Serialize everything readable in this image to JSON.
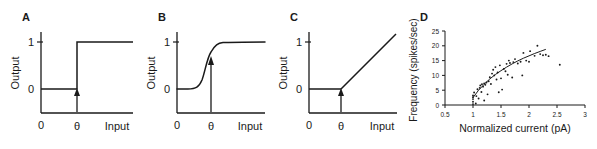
{
  "figure": {
    "background": "#ffffff",
    "ink": "#1a1a1a",
    "panel_count": 4
  },
  "panels": {
    "a": {
      "letter": "A"
    },
    "b": {
      "letter": "B"
    },
    "c": {
      "letter": "C"
    },
    "d": {
      "letter": "D"
    }
  },
  "chart_data": [
    {
      "id": "A",
      "type": "line",
      "title": "",
      "subtitle": "",
      "xlabel": "Input",
      "ylabel": "Output",
      "xticks": [
        0
      ],
      "xticklabels": [
        "0"
      ],
      "yticks": [
        0,
        1
      ],
      "yticklabels": [
        "0",
        "1"
      ],
      "xlim": [
        0,
        10
      ],
      "ylim": [
        0,
        1.25
      ],
      "grid": false,
      "legend": null,
      "function": "heaviside-step",
      "threshold_label": "θ",
      "threshold_x": 4.0,
      "annotations": [
        {
          "kind": "arrow",
          "label": "θ",
          "x": 4.0,
          "points_to_y": 0.0,
          "direction": "up"
        }
      ],
      "x": [
        0,
        1,
        2,
        3,
        3.99,
        4.0,
        5,
        6,
        7,
        8,
        9,
        10
      ],
      "values": [
        0,
        0,
        0,
        0,
        0,
        1,
        1,
        1,
        1,
        1,
        1,
        1
      ]
    },
    {
      "id": "B",
      "type": "line",
      "title": "",
      "subtitle": "",
      "xlabel": "Input",
      "ylabel": "Output",
      "xticks": [
        0
      ],
      "xticklabels": [
        "0"
      ],
      "yticks": [
        0,
        1
      ],
      "yticklabels": [
        "0",
        "1"
      ],
      "xlim": [
        0,
        10
      ],
      "ylim": [
        0,
        1.25
      ],
      "grid": false,
      "legend": null,
      "function": "logistic-sigmoid",
      "threshold_label": "θ",
      "threshold_x": 4.0,
      "annotations": [
        {
          "kind": "arrow",
          "label": "θ",
          "x": 4.0,
          "points_to_y": 0.5,
          "direction": "up"
        }
      ],
      "x": [
        0,
        0.5,
        1,
        1.5,
        2,
        2.5,
        3,
        3.5,
        4,
        4.5,
        5,
        5.5,
        6,
        6.5,
        7,
        8,
        9,
        10
      ],
      "values": [
        0.0,
        0.0,
        0.01,
        0.02,
        0.04,
        0.09,
        0.18,
        0.32,
        0.5,
        0.68,
        0.82,
        0.91,
        0.96,
        0.98,
        0.99,
        1.0,
        1.0,
        1.0
      ]
    },
    {
      "id": "C",
      "type": "line",
      "title": "",
      "subtitle": "",
      "xlabel": "Input",
      "ylabel": "Output",
      "xticks": [
        0
      ],
      "xticklabels": [
        "0"
      ],
      "yticks": [
        0,
        1
      ],
      "yticklabels": [
        "0",
        "1"
      ],
      "xlim": [
        0,
        10
      ],
      "ylim": [
        0,
        1.5
      ],
      "grid": false,
      "legend": null,
      "function": "rectified-linear-ramp",
      "threshold_label": "θ",
      "threshold_x": 4.0,
      "annotations": [
        {
          "kind": "arrow",
          "label": "θ",
          "x": 4.0,
          "points_to_y": 0.0,
          "direction": "up"
        }
      ],
      "x": [
        0,
        1,
        2,
        3,
        4,
        5,
        6,
        7,
        8,
        9,
        10
      ],
      "values": [
        0,
        0,
        0,
        0,
        0,
        0.235,
        0.47,
        0.705,
        0.94,
        1.175,
        1.41
      ]
    },
    {
      "id": "D",
      "type": "scatter",
      "title": "",
      "subtitle": "",
      "xlabel": "Normalized current (pA)",
      "ylabel": "Frequency (spikes/sec)",
      "xticks": [
        0.5,
        1,
        1.5,
        2,
        2.5,
        3
      ],
      "xticklabels": [
        "0.5",
        "1",
        "1.5",
        "2",
        "2.5",
        "3"
      ],
      "yticks": [
        0,
        5,
        10,
        15,
        20,
        25
      ],
      "yticklabels": [
        "0",
        "5",
        "10",
        "15",
        "20",
        "25"
      ],
      "xlim": [
        0.5,
        3
      ],
      "ylim": [
        0,
        25
      ],
      "grid": false,
      "legend": null,
      "points": [
        [
          1.0,
          0.3
        ],
        [
          1.0,
          1.1
        ],
        [
          1.0,
          2.0
        ],
        [
          1.0,
          2.6
        ],
        [
          1.0,
          3.2
        ],
        [
          1.02,
          4.2
        ],
        [
          1.05,
          0.5
        ],
        [
          1.06,
          3.0
        ],
        [
          1.08,
          5.3
        ],
        [
          1.1,
          2.2
        ],
        [
          1.12,
          5.8
        ],
        [
          1.13,
          6.6
        ],
        [
          1.15,
          4.4
        ],
        [
          1.16,
          7.0
        ],
        [
          1.18,
          6.2
        ],
        [
          1.2,
          1.5
        ],
        [
          1.2,
          7.3
        ],
        [
          1.22,
          6.8
        ],
        [
          1.24,
          7.6
        ],
        [
          1.26,
          3.6
        ],
        [
          1.28,
          8.0
        ],
        [
          1.3,
          9.4
        ],
        [
          1.32,
          7.1
        ],
        [
          1.34,
          10.6
        ],
        [
          1.36,
          11.9
        ],
        [
          1.38,
          10.0
        ],
        [
          1.4,
          12.8
        ],
        [
          1.42,
          8.6
        ],
        [
          1.44,
          11.0
        ],
        [
          1.46,
          4.3
        ],
        [
          1.48,
          13.4
        ],
        [
          1.5,
          9.0
        ],
        [
          1.52,
          5.2
        ],
        [
          1.55,
          12.2
        ],
        [
          1.58,
          11.4
        ],
        [
          1.6,
          13.9
        ],
        [
          1.62,
          10.2
        ],
        [
          1.64,
          15.0
        ],
        [
          1.66,
          14.2
        ],
        [
          1.7,
          9.3
        ],
        [
          1.72,
          14.5
        ],
        [
          1.75,
          15.5
        ],
        [
          1.8,
          14.0
        ],
        [
          1.85,
          14.6
        ],
        [
          1.88,
          10.0
        ],
        [
          1.9,
          17.6
        ],
        [
          1.95,
          15.0
        ],
        [
          2.0,
          14.6
        ],
        [
          2.02,
          18.2
        ],
        [
          2.1,
          16.6
        ],
        [
          2.15,
          20.0
        ],
        [
          2.2,
          17.2
        ],
        [
          2.25,
          16.8
        ],
        [
          2.3,
          17.0
        ],
        [
          2.35,
          16.5
        ],
        [
          2.55,
          13.6
        ]
      ],
      "fit_curve": {
        "label": "",
        "style": "solid",
        "x": [
          1.0,
          1.1,
          1.2,
          1.3,
          1.4,
          1.5,
          1.6,
          1.7,
          1.8,
          1.9,
          2.0,
          2.1,
          2.2,
          2.3
        ],
        "values": [
          2.5,
          5.0,
          7.0,
          8.8,
          10.3,
          11.6,
          12.8,
          13.9,
          14.9,
          15.8,
          16.6,
          17.4,
          18.1,
          18.8
        ]
      }
    }
  ]
}
